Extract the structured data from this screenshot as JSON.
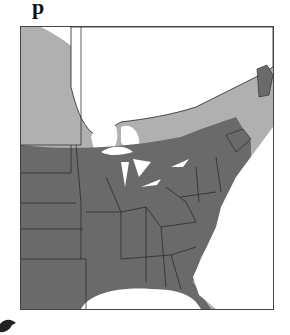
{
  "map": {
    "title_fragment": "p",
    "region": "Eastern North America",
    "legend": [],
    "colors": {
      "breeding_range": "#b0b0b0",
      "year_round_range": "#6a6a6a",
      "absent": "#ffffff",
      "border": "#222222",
      "frame": "#444444"
    }
  }
}
